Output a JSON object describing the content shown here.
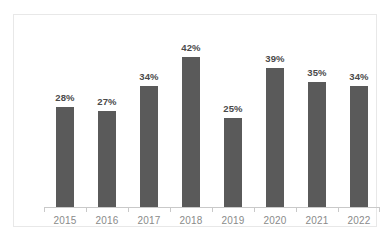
{
  "chart_data": {
    "type": "bar",
    "title": "",
    "subtitle": "",
    "xlabel": "",
    "ylabel": "",
    "categories": [
      "2015",
      "2016",
      "2017",
      "2018",
      "2019",
      "2020",
      "2021",
      "2022"
    ],
    "values": [
      28,
      27,
      34,
      42,
      25,
      39,
      35,
      34
    ],
    "value_labels": [
      "28%",
      "27%",
      "34%",
      "42%",
      "25%",
      "39%",
      "35%",
      "34%"
    ],
    "ylim": [
      0,
      50
    ],
    "grid": false,
    "legend": false,
    "legend_position": "none",
    "series": [
      {
        "name": "",
        "values": [
          28,
          27,
          34,
          42,
          25,
          39,
          35,
          34
        ]
      }
    ],
    "annotations": []
  },
  "style": {
    "bar_color": "#5a5a5a",
    "value_label_color": "#4a4a4a",
    "axis_label_color": "#8a8a8a",
    "axis_line_color": "#c9c9c9",
    "frame_border_color": "#e8e8e8",
    "background_color": "#ffffff"
  }
}
